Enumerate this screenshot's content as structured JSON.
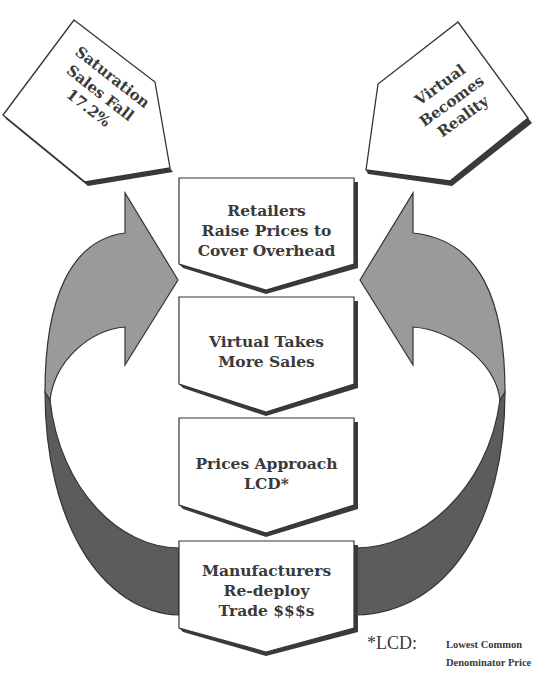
{
  "diagram": {
    "top_left_pentagon": {
      "lines": [
        "Saturation",
        "Sales Fall",
        "17.2%"
      ]
    },
    "top_right_pentagon": {
      "lines": [
        "Virtual",
        "Becomes",
        "Reality"
      ]
    },
    "flow_boxes": [
      {
        "lines": [
          "Retailers",
          "Raise Prices to",
          "Cover Overhead"
        ]
      },
      {
        "lines": [
          "Virtual Takes",
          "More Sales"
        ]
      },
      {
        "lines": [
          "Prices Approach",
          "LCD*"
        ]
      },
      {
        "lines": [
          "Manufacturers",
          "Re-deploy",
          "Trade $$$s"
        ]
      }
    ],
    "footnote": {
      "key": "*LCD:",
      "text_lines": [
        "Lowest Common",
        "Denominator Price"
      ]
    },
    "colors": {
      "light_arrow": "#9a9a9a",
      "dark_band": "#5c5c5c",
      "outline": "#333333",
      "shadow": "#3a3a3a",
      "box_fill": "#ffffff",
      "text": "#3a3a3a"
    }
  }
}
